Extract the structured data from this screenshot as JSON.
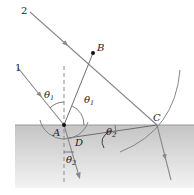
{
  "diagram": {
    "type": "refraction-huygens-construction",
    "colors": {
      "ray": "#8a8a8a",
      "construction": "#6e6e6e",
      "interface": "#9a9a9a",
      "medium2_top": "#c9c9c9",
      "medium2_bottom": "#f2f2f2",
      "point": "#111111"
    },
    "rays": [
      {
        "label": "1"
      },
      {
        "label": "2"
      }
    ],
    "points": [
      {
        "label": "A"
      },
      {
        "label": "B"
      },
      {
        "label": "C"
      },
      {
        "label": "D"
      }
    ],
    "angles": {
      "theta1_symbol": "θ",
      "theta1_sub": "1",
      "theta2_symbol": "θ",
      "theta2_sub": "2"
    }
  }
}
